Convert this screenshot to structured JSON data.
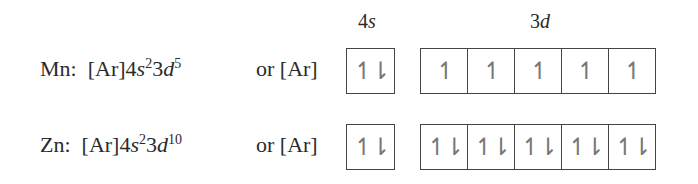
{
  "headers": {
    "s_label_num": "4",
    "s_label_letter": "s",
    "d_label_num": "3",
    "d_label_letter": "d"
  },
  "rows": [
    {
      "element": "Mn:",
      "core": "[Ar]",
      "s_shell": "4",
      "s_letter": "s",
      "s_count": "2",
      "d_shell": "3",
      "d_letter": "d",
      "d_count": "5",
      "or_text": "or [Ar]",
      "orbital_4s": "↿⇂",
      "orbitals_3d": [
        "↿",
        "↿",
        "↿",
        "↿",
        "↿"
      ]
    },
    {
      "element": "Zn:",
      "core": "[Ar]",
      "s_shell": "4",
      "s_letter": "s",
      "s_count": "2",
      "d_shell": "3",
      "d_letter": "d",
      "d_count": "10",
      "or_text": "or [Ar]",
      "orbital_4s": "↿⇂",
      "orbitals_3d": [
        "↿⇂",
        "↿⇂",
        "↿⇂",
        "↿⇂",
        "↿⇂"
      ]
    }
  ]
}
